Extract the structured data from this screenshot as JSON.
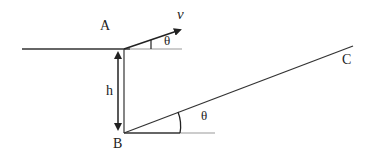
{
  "diagram": {
    "type": "physics-geometry",
    "labels": {
      "point_a": "A",
      "point_b": "B",
      "point_c": "C",
      "velocity": "v",
      "height": "h",
      "angle_top": "θ",
      "angle_bottom": "θ"
    },
    "colors": {
      "line": "#222222",
      "light_line": "#999999"
    }
  }
}
